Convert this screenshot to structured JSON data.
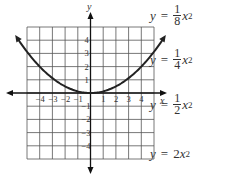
{
  "chart_data": {
    "type": "line",
    "title": "",
    "xlabel": "x",
    "ylabel": "y",
    "xlim": [
      -5,
      5
    ],
    "ylim": [
      -5,
      5
    ],
    "grid": true,
    "x_tick_labels": [
      "-4",
      "-3",
      "-2",
      "-1",
      "1",
      "2",
      "3",
      "4"
    ],
    "y_tick_labels": [
      "4",
      "3",
      "2",
      "1",
      "-1",
      "-2",
      "-3",
      "-4"
    ],
    "series": [
      {
        "name": "parabola",
        "function": "y = (1/8)x^2",
        "x": [
          -6,
          -5,
          -4,
          -3,
          -2,
          -1,
          0,
          1,
          2,
          3,
          4,
          5,
          6
        ],
        "y": [
          4.5,
          3.125,
          2,
          1.125,
          0.5,
          0.125,
          0,
          0.125,
          0.5,
          1.125,
          2,
          3.125,
          4.5
        ]
      }
    ],
    "answer_choices": [
      "y = 1/8 x^2",
      "y = 1/4 x^2",
      "y = 1/2 x^2",
      "y = 2x^2"
    ]
  },
  "axes": {
    "x_label": "x",
    "y_label": "y"
  },
  "choices": [
    {
      "lhs": "y",
      "eq": "=",
      "num": "1",
      "den": "8",
      "var": "x",
      "exp": "2"
    },
    {
      "lhs": "y",
      "eq": "=",
      "num": "1",
      "den": "4",
      "var": "x",
      "exp": "2"
    },
    {
      "lhs": "y",
      "eq": "=",
      "num": "1",
      "den": "2",
      "var": "x",
      "exp": "2"
    },
    {
      "lhs": "y",
      "eq": "=",
      "coef": "2",
      "var": "x",
      "exp": "2"
    }
  ],
  "colors": {
    "grid": "#444444",
    "curve": "#222222",
    "text": "#333333"
  }
}
